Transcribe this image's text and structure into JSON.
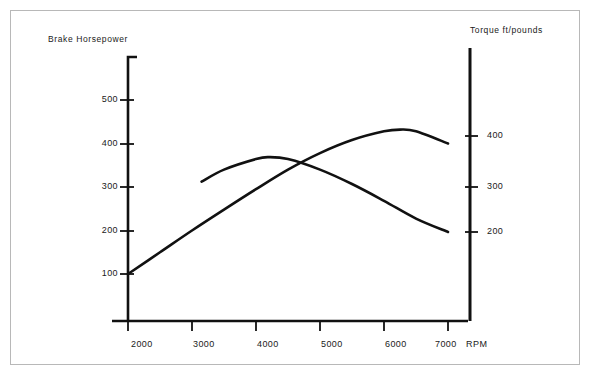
{
  "chart_data": {
    "type": "line",
    "title": "",
    "xlabel": "RPM",
    "x_unit_label": "RPM",
    "xticks": [
      "2000",
      "3000",
      "4000",
      "5000",
      "6000",
      "7000"
    ],
    "xlim": [
      1500,
      7500
    ],
    "grid": false,
    "legend_position": "none",
    "axes": [
      {
        "id": "left",
        "label": "Brake Horsepower",
        "position": "left",
        "ticks": [
          "100",
          "200",
          "300",
          "400",
          "500"
        ],
        "tick_values": [
          100,
          200,
          300,
          400,
          500
        ],
        "ylim": [
          0,
          600
        ]
      },
      {
        "id": "right",
        "label": "Torque ft/pounds",
        "position": "right",
        "ticks": [
          "200",
          "300",
          "400"
        ],
        "tick_values": [
          200,
          300,
          400
        ],
        "ylim": [
          0,
          520
        ]
      }
    ],
    "series": [
      {
        "name": "Brake Horsepower",
        "axis": "left",
        "color": "#111111",
        "x": [
          2000,
          2500,
          3000,
          3500,
          4000,
          4500,
          5000,
          5500,
          6000,
          6250,
          6500,
          7000
        ],
        "values": [
          100,
          150,
          200,
          248,
          295,
          340,
          378,
          408,
          428,
          432,
          428,
          400
        ]
      },
      {
        "name": "Torque ft/pounds",
        "axis": "right",
        "color": "#111111",
        "x": [
          3150,
          3500,
          4000,
          4200,
          4500,
          5000,
          5500,
          6000,
          6500,
          7000
        ],
        "values": [
          305,
          330,
          352,
          356,
          352,
          330,
          300,
          265,
          228,
          200
        ]
      }
    ],
    "annotations": [
      {
        "name": "curve-crossing",
        "x": 4480,
        "note": "horsepower curve crosses torque curve"
      }
    ]
  }
}
